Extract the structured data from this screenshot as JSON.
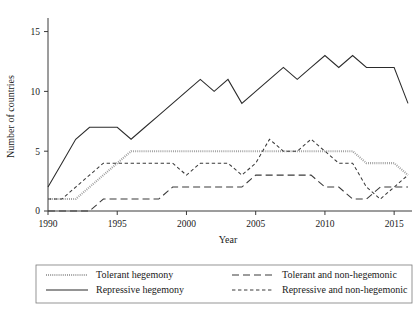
{
  "chart_data": {
    "type": "line",
    "title": "",
    "xlabel": "Year",
    "ylabel": "Number of countries",
    "xlim": [
      1990,
      2016
    ],
    "ylim": [
      0,
      15.8
    ],
    "xticks": [
      1990,
      1995,
      2000,
      2005,
      2010,
      2015
    ],
    "yticks": [
      0,
      5,
      10,
      15
    ],
    "grid": false,
    "legend_position": "below-axes",
    "x": [
      1990,
      1991,
      1992,
      1993,
      1994,
      1995,
      1996,
      1997,
      1998,
      1999,
      2000,
      2001,
      2002,
      2003,
      2004,
      2005,
      2006,
      2007,
      2008,
      2009,
      2010,
      2011,
      2012,
      2013,
      2014,
      2015,
      2016
    ],
    "series": [
      {
        "name": "Tolerant hegemony",
        "style": "dotted",
        "color": "#9a9a9a",
        "values": [
          1,
          1,
          1,
          2,
          3,
          4,
          5,
          5,
          5,
          5,
          5,
          5,
          5,
          5,
          5,
          5,
          5,
          5,
          5,
          5,
          5,
          5,
          5,
          4,
          4,
          4,
          3
        ]
      },
      {
        "name": "Repressive hegemony",
        "style": "solid",
        "color": "#2b2b2b",
        "values": [
          2,
          4,
          6,
          7,
          7,
          7,
          6,
          7,
          8,
          9,
          10,
          11,
          10,
          11,
          9,
          10,
          11,
          12,
          11,
          12,
          13,
          12,
          13,
          12,
          12,
          12,
          9
        ]
      },
      {
        "name": "Tolerant and non-hegemonic",
        "style": "long-dash",
        "color": "#3a3a3a",
        "values": [
          0,
          0,
          0,
          0,
          1,
          1,
          1,
          1,
          1,
          2,
          2,
          2,
          2,
          2,
          2,
          3,
          3,
          3,
          3,
          3,
          2,
          2,
          1,
          1,
          2,
          2,
          2
        ]
      },
      {
        "name": "Repressive and non-hegemonic",
        "style": "short-dash",
        "color": "#3a3a3a",
        "values": [
          1,
          1,
          2,
          3,
          4,
          4,
          4,
          4,
          4,
          4,
          3,
          4,
          4,
          4,
          3,
          4,
          6,
          5,
          5,
          6,
          5,
          4,
          4,
          2,
          1,
          2,
          3
        ]
      }
    ]
  },
  "legend": {
    "entries": [
      {
        "label": "Tolerant hegemony",
        "style": "dotted"
      },
      {
        "label": "Tolerant and non-hegemonic",
        "style": "long-dash"
      },
      {
        "label": "Repressive hegemony",
        "style": "solid"
      },
      {
        "label": "Repressive and non-hegemonic",
        "style": "short-dash"
      }
    ]
  }
}
